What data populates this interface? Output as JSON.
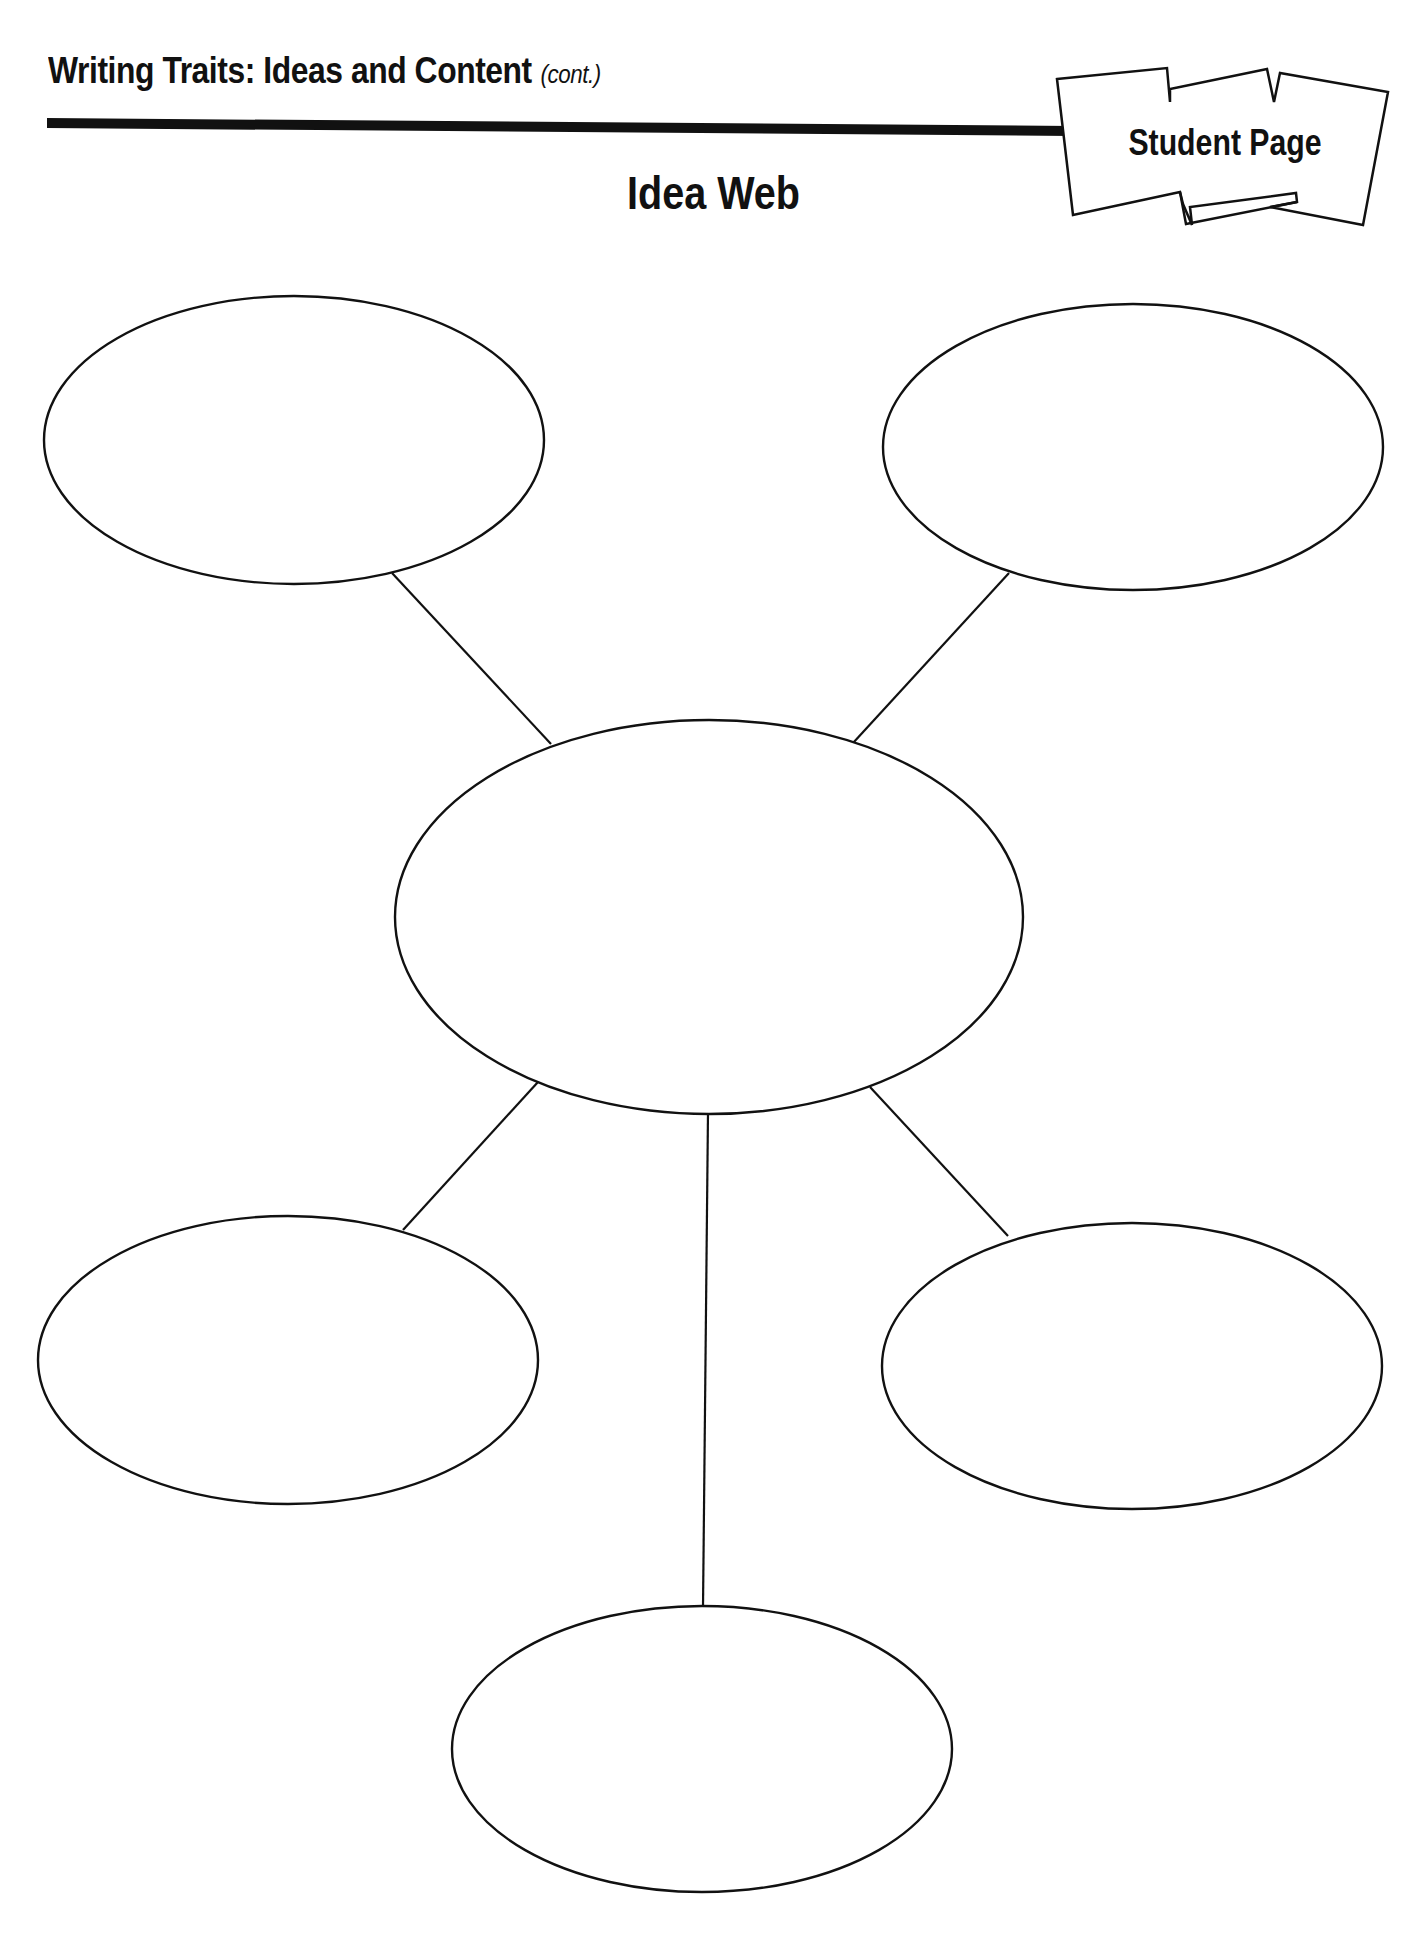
{
  "header": {
    "title": "Writing Traits: Ideas and Content",
    "title_suffix": "(cont.)",
    "badge_label": "Student Page"
  },
  "page": {
    "title": "Idea Web"
  },
  "diagram": {
    "type": "idea-web",
    "stroke_color": "#111111",
    "background_color": "#ffffff",
    "center_node": {
      "id": "center",
      "text": ""
    },
    "nodes": [
      {
        "id": "top-left",
        "text": ""
      },
      {
        "id": "top-right",
        "text": ""
      },
      {
        "id": "bottom-left",
        "text": ""
      },
      {
        "id": "bottom-right",
        "text": ""
      },
      {
        "id": "bottom",
        "text": ""
      }
    ],
    "edges": [
      {
        "from": "center",
        "to": "top-left"
      },
      {
        "from": "center",
        "to": "top-right"
      },
      {
        "from": "center",
        "to": "bottom-left"
      },
      {
        "from": "center",
        "to": "bottom-right"
      },
      {
        "from": "center",
        "to": "bottom"
      }
    ]
  }
}
